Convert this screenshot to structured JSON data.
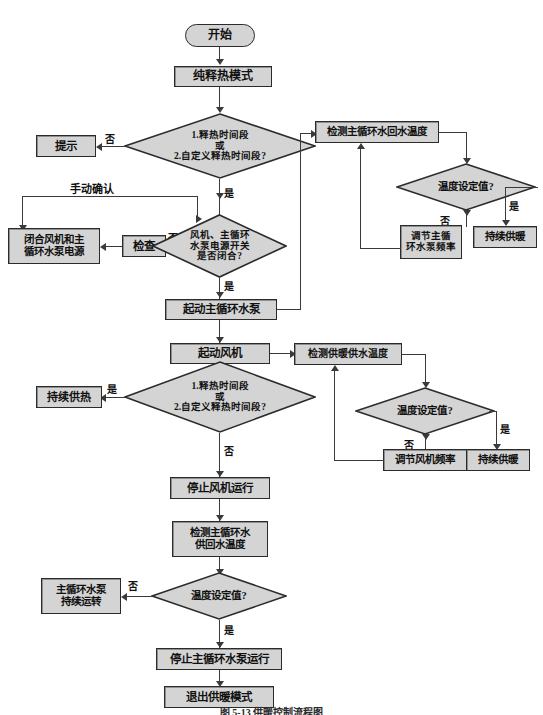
{
  "figure": {
    "caption": "图 5-13  供暖控制流程图",
    "fill_color": "#d4d4d4",
    "stroke_color": "#2b2b2b",
    "line_color": "#3a3a3a",
    "background": "#ffffff"
  },
  "nodes": {
    "start": "开始",
    "mode": "纯释热模式",
    "decision1_line1": "1.释热时间段",
    "decision1_line2": "或",
    "decision1_line3": "2.自定义释热时间段?",
    "prompt": "提示",
    "close_power_line1": "闭合风机和主",
    "close_power_line2": "循环水泵电源",
    "check": "检查",
    "decision2_line1": "风机、主循环",
    "decision2_line2": "水泵电源开关",
    "decision2_line3": "是否闭合?",
    "start_pump": "起动主循环水泵",
    "start_fan": "起动风机",
    "decision3_line1": "1.释热时间段",
    "decision3_line2": "或",
    "decision3_line3": "2.自定义释热时间段?",
    "keep_heat": "持续供热",
    "stop_fan": "停止风机运行",
    "detect_supply_return_line1": "检测主循环水",
    "detect_supply_return_line2": "供回水温度",
    "decision5": "温度设定值?",
    "pump_keep_line1": "主循环水泵",
    "pump_keep_line2": "持续运转",
    "stop_pump": "停止主循环水泵运行",
    "exit_mode": "退出供暖模式",
    "detect_return_temp": "检测主循环水回水温度",
    "decision_r1": "温度设定值?",
    "adjust_pump_line1": "调节主循",
    "adjust_pump_line2": "环水泵频率",
    "keep_warm_r1": "持续供暖",
    "detect_supply_temp": "检测供暖供水温度",
    "decision_r2": "温度设定值?",
    "adjust_fan": "调节风机频率",
    "keep_warm_r2": "持续供暖"
  },
  "edge_labels": {
    "no_1": "否",
    "yes_1": "是",
    "manual_confirm": "手动确认",
    "no_2": "否",
    "yes_2": "是",
    "yes_3": "是",
    "no_3": "否",
    "no_4": "否",
    "yes_4": "是",
    "no_r1": "否",
    "yes_r1": "是",
    "no_r2": "否",
    "yes_r2": "是"
  }
}
